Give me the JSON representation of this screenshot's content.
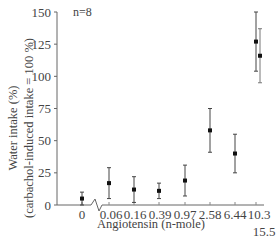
{
  "chart_data": {
    "type": "scatter",
    "title": "",
    "annotation": "n=8",
    "xlabel": "Angiotensin (n-mole)",
    "ylabel_line1": "Water intake (%)",
    "ylabel_line2": "(carbachol-induced intake = 100 %)",
    "ylim": [
      0,
      150
    ],
    "yticks": [
      0,
      25,
      50,
      75,
      100,
      125,
      150
    ],
    "ytick_labels": [
      "0",
      "25",
      "50",
      "75",
      "100",
      "125",
      "150"
    ],
    "categories": [
      "0",
      "0.06",
      "0.16",
      "0.39",
      "0.97",
      "2.58",
      "6.44",
      "10.3",
      "15.5"
    ],
    "axis_break_between": [
      "0",
      "0.06"
    ],
    "grid": false,
    "legend": null,
    "series": [
      {
        "name": "Water intake",
        "values": [
          5,
          17,
          12,
          11,
          19,
          58,
          40,
          127,
          116
        ],
        "error": [
          5,
          12,
          10,
          6,
          12,
          17,
          15,
          23,
          21
        ]
      }
    ]
  }
}
